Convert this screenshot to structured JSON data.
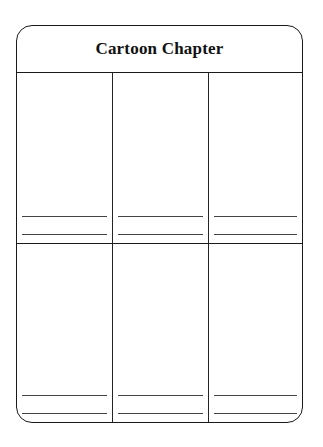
{
  "worksheet": {
    "title": "Cartoon Chapter",
    "layout": {
      "columns": 3,
      "rows": 2,
      "caption_lines_per_panel": 2
    },
    "panels": [
      {
        "row": 1,
        "col": 1,
        "caption_lines": [
          "",
          ""
        ]
      },
      {
        "row": 1,
        "col": 2,
        "caption_lines": [
          "",
          ""
        ]
      },
      {
        "row": 1,
        "col": 3,
        "caption_lines": [
          "",
          ""
        ]
      },
      {
        "row": 2,
        "col": 1,
        "caption_lines": [
          "",
          ""
        ]
      },
      {
        "row": 2,
        "col": 2,
        "caption_lines": [
          "",
          ""
        ]
      },
      {
        "row": 2,
        "col": 3,
        "caption_lines": [
          "",
          ""
        ]
      }
    ],
    "colors": {
      "ink": "#1a1a1a",
      "paper": "#ffffff"
    }
  }
}
